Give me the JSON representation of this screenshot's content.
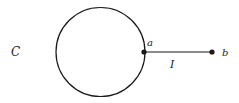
{
  "diagram": {
    "labels": {
      "region": "C",
      "point_a": "a",
      "point_b": "b",
      "segment": "I"
    },
    "colors": {
      "stroke": "#1a1a1a",
      "background": "#ffffff"
    },
    "shapes": {
      "circle": {
        "cx": 100.5,
        "cy": 52,
        "r": 44.5
      },
      "segment": {
        "x1": 144,
        "y1": 52,
        "x2": 212,
        "y2": 52
      },
      "point_a": {
        "cx": 144,
        "cy": 52
      },
      "point_b": {
        "cx": 212,
        "cy": 52
      }
    }
  }
}
